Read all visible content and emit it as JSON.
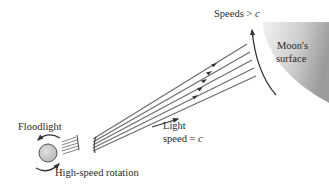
{
  "diagram": {
    "type": "physics-illustration",
    "labels": {
      "floodlight": "Floodlight",
      "rotation": "High-speed rotation",
      "light_line1": "Light",
      "light_line2_prefix": "speed = ",
      "light_var": "c",
      "speeds_prefix": "Speeds > ",
      "speeds_var": "c",
      "moon_line1": "Moon's",
      "moon_line2": "surface"
    },
    "beam": {
      "ray_count": 5,
      "arrows_per_ray": 1
    },
    "colors": {
      "ray": "#666666",
      "arrow": "#333333",
      "moon_light": "#f2f2f2",
      "moon_dark": "#9a9a9a",
      "lamp_fill": "#c8c8c8",
      "text": "#2a2a2a"
    }
  }
}
